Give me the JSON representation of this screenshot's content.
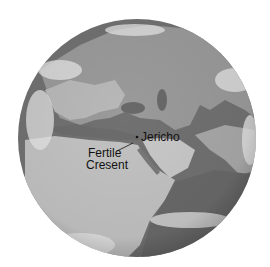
{
  "map": {
    "type": "satellite-globe",
    "style": "grayscale",
    "region": "Europe, Africa, Middle East, Asia",
    "colors": {
      "background": "#ffffff",
      "ocean": "#6e6e6e",
      "land_light": "#bdbdbd",
      "land_dark": "#8a8a8a",
      "cloud": "#e8e8e8",
      "label_text": "#111111"
    }
  },
  "labels": {
    "jericho": "Jericho",
    "fertile_line1": "Fertile",
    "fertile_line2": "Cresent"
  },
  "markers": [
    {
      "name": "Jericho",
      "type": "point"
    }
  ]
}
